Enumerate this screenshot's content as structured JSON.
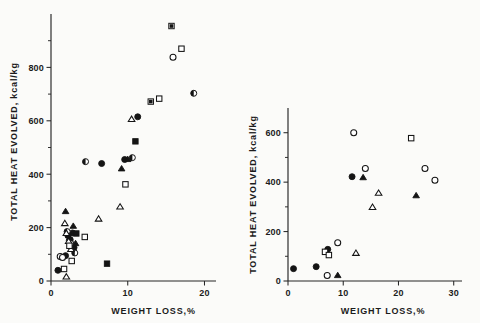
{
  "figure": {
    "background": "#fbfbf9",
    "ink": "#141414",
    "panel_count": 2
  },
  "chart_data": [
    {
      "id": "left",
      "type": "scatter",
      "title": "",
      "xlabel": "WEIGHT LOSS,%",
      "ylabel": "TOTAL HEAT EVOLVED, kcal/kg",
      "xlim": [
        0,
        21.5
      ],
      "ylim": [
        0,
        1000
      ],
      "xticks": [
        0,
        10,
        20
      ],
      "xticklabels": [
        "0",
        "10",
        "20"
      ],
      "yticks": [
        0,
        200,
        400,
        600,
        800
      ],
      "yticklabels": [
        "0",
        "200",
        "400",
        "600",
        "800"
      ],
      "y_minor_ticks": [
        100,
        300,
        500,
        700,
        900
      ],
      "grid": false,
      "legend": "none",
      "series": [
        {
          "name": "filled-circle",
          "marker": "filled-circle",
          "points": [
            [
              0.9,
              40
            ],
            [
              1.9,
              95
            ],
            [
              2.2,
              170
            ],
            [
              2.5,
              155
            ],
            [
              2.8,
              180
            ],
            [
              3.0,
              125
            ],
            [
              6.6,
              440
            ],
            [
              9.6,
              455
            ],
            [
              11.3,
              615
            ]
          ]
        },
        {
          "name": "open-circle",
          "marker": "open-circle",
          "points": [
            [
              1.2,
              92
            ],
            [
              1.5,
              88
            ],
            [
              15.9,
              838
            ]
          ]
        },
        {
          "name": "half-circle",
          "marker": "half-circle",
          "points": [
            [
              2.1,
              185
            ],
            [
              2.6,
              140
            ],
            [
              3.1,
              105
            ],
            [
              4.5,
              447
            ],
            [
              10.6,
              462
            ],
            [
              18.6,
              703
            ]
          ]
        },
        {
          "name": "filled-triangle",
          "marker": "filled-triangle",
          "points": [
            [
              1.9,
              260
            ],
            [
              2.4,
              160
            ],
            [
              2.9,
              205
            ],
            [
              3.2,
              140
            ],
            [
              9.2,
              420
            ],
            [
              10.0,
              455
            ]
          ]
        },
        {
          "name": "open-triangle",
          "marker": "open-triangle",
          "points": [
            [
              1.8,
              215
            ],
            [
              2.0,
              178
            ],
            [
              2.3,
              148
            ],
            [
              2.6,
              118
            ],
            [
              2.0,
              15
            ],
            [
              6.2,
              232
            ],
            [
              9.0,
              277
            ],
            [
              10.5,
              605
            ]
          ]
        },
        {
          "name": "filled-square",
          "marker": "filled-square",
          "points": [
            [
              3.3,
              178
            ],
            [
              7.3,
              65
            ],
            [
              11.0,
              523
            ]
          ]
        },
        {
          "name": "open-square",
          "marker": "open-square",
          "points": [
            [
              1.7,
              45
            ],
            [
              2.4,
              132
            ],
            [
              2.7,
              75
            ],
            [
              4.4,
              165
            ],
            [
              9.7,
              362
            ],
            [
              14.1,
              683
            ],
            [
              17.0,
              870
            ]
          ]
        },
        {
          "name": "half-square",
          "marker": "half-square",
          "points": [
            [
              13.0,
              672
            ],
            [
              15.7,
              955
            ]
          ]
        }
      ]
    },
    {
      "id": "right",
      "type": "scatter",
      "title": "",
      "xlabel": "WEIGHT LOSS,%",
      "ylabel": "TOTAL HEAT EVOLVED, kcal/kg",
      "xlim": [
        0,
        31.5
      ],
      "ylim": [
        0,
        700
      ],
      "xticks": [
        0,
        10,
        20,
        30
      ],
      "xticklabels": [
        "0",
        "10",
        "20",
        "30"
      ],
      "yticks": [
        0,
        200,
        400,
        600
      ],
      "yticklabels": [
        "0",
        "200",
        "400",
        "600"
      ],
      "y_minor_ticks": [
        100,
        300,
        500
      ],
      "grid": false,
      "legend": "none",
      "series": [
        {
          "name": "filled-circle",
          "marker": "filled-circle",
          "points": [
            [
              1.0,
              50
            ],
            [
              5.1,
              58
            ],
            [
              7.2,
              128
            ],
            [
              11.6,
              422
            ]
          ]
        },
        {
          "name": "open-circle",
          "marker": "open-circle",
          "points": [
            [
              7.1,
              22
            ],
            [
              9.0,
              155
            ],
            [
              11.9,
              600
            ],
            [
              14.0,
              455
            ],
            [
              24.8,
              455
            ],
            [
              26.6,
              408
            ]
          ]
        },
        {
          "name": "filled-triangle",
          "marker": "filled-triangle",
          "points": [
            [
              9.0,
              22
            ],
            [
              13.6,
              418
            ],
            [
              23.2,
              345
            ]
          ]
        },
        {
          "name": "open-triangle",
          "marker": "open-triangle",
          "points": [
            [
              12.3,
              112
            ],
            [
              15.3,
              298
            ],
            [
              16.4,
              355
            ]
          ]
        },
        {
          "name": "open-square",
          "marker": "open-square",
          "points": [
            [
              6.7,
              118
            ],
            [
              7.4,
              105
            ],
            [
              22.3,
              578
            ]
          ]
        }
      ]
    }
  ]
}
